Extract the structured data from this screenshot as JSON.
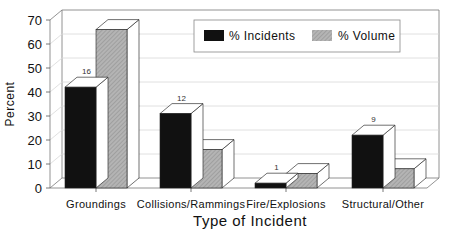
{
  "chart_data": {
    "type": "bar",
    "title": "",
    "xlabel": "Type of Incident",
    "ylabel": "Percent",
    "ylim": [
      0,
      70
    ],
    "yticks": [
      0,
      10,
      20,
      30,
      40,
      50,
      60,
      70
    ],
    "grid": true,
    "legend_position": "top-right",
    "categories": [
      "Groundings",
      "Collisions/Rammings",
      "Fire/Explosions",
      "Structural/Other"
    ],
    "series": [
      {
        "name": "% Incidents",
        "values": [
          42,
          31,
          2,
          22
        ],
        "color": "#111111"
      },
      {
        "name": "% Volume",
        "values": [
          66,
          16,
          6,
          8
        ],
        "color": "#a8a8a8"
      }
    ],
    "annotations": [
      {
        "category": "Groundings",
        "label": "16"
      },
      {
        "category": "Collisions/Rammings",
        "label": "12"
      },
      {
        "category": "Fire/Explosions",
        "label": "1"
      },
      {
        "category": "Structural/Other",
        "label": "9"
      }
    ],
    "style": "3d"
  }
}
